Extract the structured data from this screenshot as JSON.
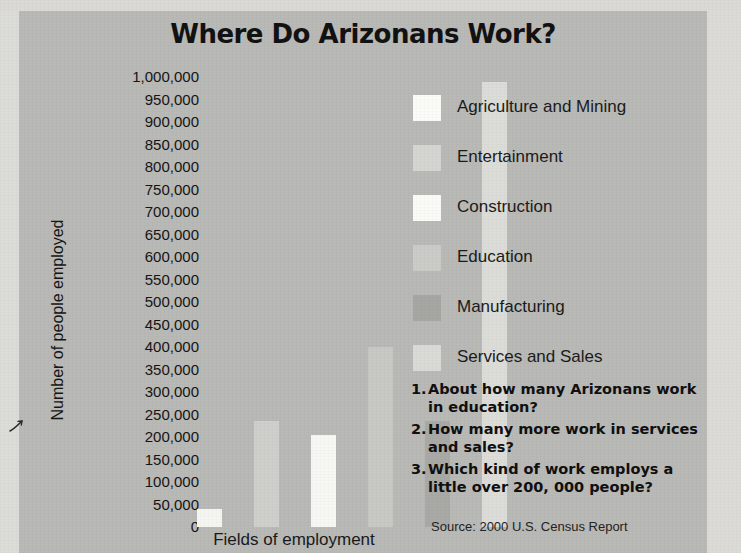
{
  "chart_data": {
    "type": "bar",
    "title": "Where Do Arizonans Work?",
    "xlabel": "Fields of employment",
    "ylabel": "Number of people employed",
    "categories": [
      "Agriculture and Mining",
      "Entertainment",
      "Construction",
      "Education",
      "Manufacturing",
      "Services and Sales"
    ],
    "values": [
      40000,
      235000,
      205000,
      400000,
      235000,
      990000
    ],
    "ylim": [
      0,
      1000000
    ],
    "ytick_step": 50000,
    "ytick_labels": [
      "1,000,000",
      "950,000",
      "900,000",
      "850,000",
      "800,000",
      "750,000",
      "700,000",
      "650,000",
      "600,000",
      "550,000",
      "500,000",
      "450,000",
      "400,000",
      "350,000",
      "300,000",
      "250,000",
      "200,000",
      "150,000",
      "100,000",
      "50,000",
      "0"
    ],
    "grid": false,
    "legend_position": "right",
    "bar_colors": [
      "#f5f5f2",
      "#cfcfcb",
      "#f7f7f4",
      "#c8c8c4",
      "#a9a9a6",
      "#dcdcd8"
    ],
    "source": "Source: 2000 U.S. Census Report"
  },
  "legend": {
    "items": [
      {
        "label": "Agriculture and Mining",
        "color": "#fbfbf8"
      },
      {
        "label": "Entertainment",
        "color": "#d5d5d1"
      },
      {
        "label": "Construction",
        "color": "#fafaf7"
      },
      {
        "label": "Education",
        "color": "#cbcbc7"
      },
      {
        "label": "Manufacturing",
        "color": "#a6a6a3"
      },
      {
        "label": "Services and Sales",
        "color": "#dadad6"
      }
    ]
  },
  "questions": [
    {
      "num": "1.",
      "text": "About how many Arizonans work in education?"
    },
    {
      "num": "2.",
      "text": "How many more work in services and sales?"
    },
    {
      "num": "3.",
      "text": "Which kind of work employs a little over  200, 000 people?"
    }
  ],
  "colors": {
    "panel_background": "#b9b9b6",
    "paper_margin": "#dcdad6",
    "text": "#121212"
  }
}
